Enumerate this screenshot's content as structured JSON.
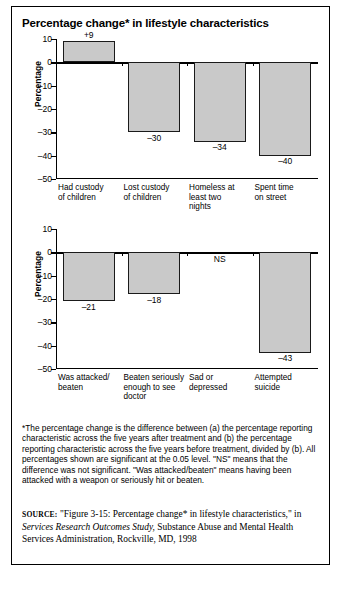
{
  "figure": {
    "title": "Percentage change* in lifestyle characteristics"
  },
  "footnote": {
    "text": "*The percentage change is the difference between (a) the percentage reporting characteristic across the five years after treatment and (b) the percentage reporting characteristic across the five years before treatment, divided by (b). All percentages shown are significant at the 0.05 level. \"NS\" means that the difference was not significant. \"Was attacked/beaten\" means having been attacked with a weapon or seriously hit or beaten."
  },
  "source": {
    "label": "SOURCE:",
    "part1": " \"Figure 3-15: Percentage change* in lifestyle characteristics,\" in ",
    "italic": "Services Research Outcomes Study,",
    "part2": " Substance Abuse and Mental Health Services Administration, Rockville, MD, 1998"
  },
  "chart_data": [
    {
      "type": "bar",
      "title": "Percentage change* in lifestyle characteristics",
      "xlabel": "",
      "ylabel": "Percentage",
      "ylim": [
        -50,
        10
      ],
      "yticks": [
        10,
        0,
        -10,
        -20,
        -30,
        -40,
        -50
      ],
      "ytick_labels": [
        "10",
        "0",
        "-10",
        "-20",
        "-30",
        "-40",
        "-50"
      ],
      "grid": false,
      "legend": "none",
      "categories": [
        "Had custody\nof children",
        "Lost custody\nof children",
        "Homeless at\nleast two\nnights",
        "Spent time\non street"
      ],
      "category_lines": [
        [
          "Had custody",
          "of children"
        ],
        [
          "Lost custody",
          "of children"
        ],
        [
          "Homeless at",
          "least two",
          "nights"
        ],
        [
          "Spent time",
          "on street"
        ]
      ],
      "values": [
        9,
        -30,
        -34,
        -40
      ],
      "value_labels": [
        "+9",
        "–30",
        "–34",
        "–40"
      ]
    },
    {
      "type": "bar",
      "title": "",
      "xlabel": "",
      "ylabel": "Percentage",
      "ylim": [
        -50,
        10
      ],
      "yticks": [
        10,
        0,
        -10,
        -20,
        -30,
        -40,
        -50
      ],
      "ytick_labels": [
        "10",
        "0",
        "-10",
        "-20",
        "-30",
        "-40",
        "-50"
      ],
      "grid": false,
      "legend": "none",
      "categories": [
        "Was attacked/\nbeaten",
        "Beaten seriously\nenough to see\ndoctor",
        "Sad or\ndepressed",
        "Attempted\nsuicide"
      ],
      "category_lines": [
        [
          "Was attacked/",
          "beaten"
        ],
        [
          "Beaten seriously",
          "enough to see",
          "doctor"
        ],
        [
          "Sad or",
          "depressed"
        ],
        [
          "Attempted",
          "suicide"
        ]
      ],
      "values": [
        -21,
        -18,
        null,
        -43
      ],
      "value_labels": [
        "–21",
        "–18",
        "NS",
        "–43"
      ]
    }
  ],
  "colors": {
    "bar_fill": "#c9c9c9",
    "bar_stroke": "#1a1a1a",
    "axis": "#000000",
    "frame": "#000000",
    "background": "#ffffff"
  }
}
